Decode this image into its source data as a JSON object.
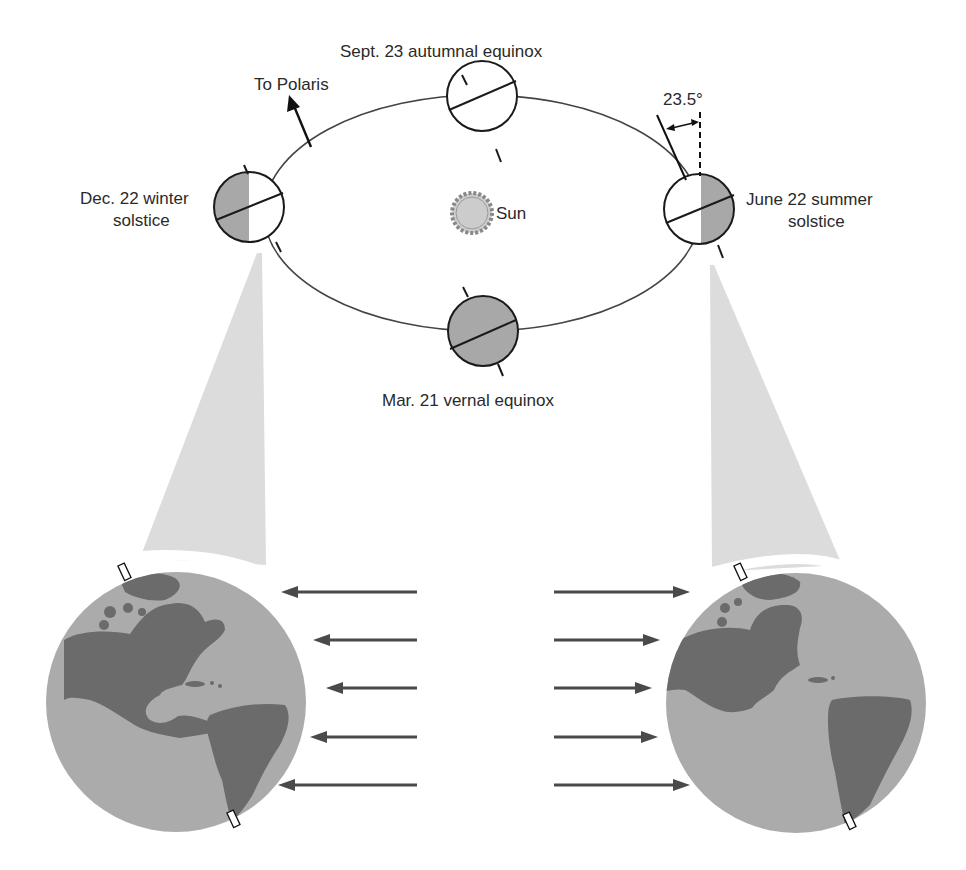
{
  "diagram": {
    "labels": {
      "polaris": "To Polaris",
      "autumnal": "Sept. 23 autumnal equinox",
      "winter_line1": "Dec. 22 winter",
      "winter_line2": "solstice",
      "summer_line1": "June 22 summer",
      "summer_line2": "solstice",
      "vernal": "Mar. 21 vernal equinox",
      "sun": "Sun",
      "tilt_angle": "23.5°"
    },
    "orbit_positions": [
      {
        "name": "winter-solstice",
        "date": "Dec. 22",
        "lit_side": "right",
        "cx": 249,
        "cy": 207
      },
      {
        "name": "autumnal-equinox",
        "date": "Sept. 23",
        "lit_side": "none-shaded",
        "cx": 482,
        "cy": 96
      },
      {
        "name": "summer-solstice",
        "date": "June 22",
        "lit_side": "left",
        "cx": 699,
        "cy": 209
      },
      {
        "name": "vernal-equinox",
        "date": "Mar. 21",
        "lit_side": "all-shaded",
        "cx": 483,
        "cy": 331
      }
    ],
    "sunlight_rays": {
      "left_globe_count": 5,
      "right_globe_count": 5,
      "direction_left": "toward-left-globe",
      "direction_right": "toward-right-globe"
    },
    "colors": {
      "ocean": "#ababab",
      "land": "#6b6b6b",
      "cone": "#dcdcdc",
      "shadow": "#a8a8a8",
      "line": "#1a1a1a",
      "ray": "#4a4a4a"
    }
  }
}
